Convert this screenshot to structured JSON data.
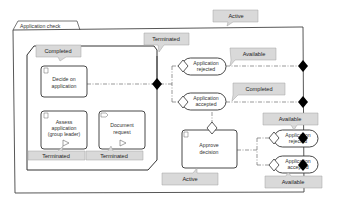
{
  "diagram": {
    "type": "CMMN case plan",
    "case": {
      "name": "Application check",
      "state": "Active"
    },
    "stage": {
      "state": "Completed",
      "exit_state": "Terminated"
    },
    "tasks": [
      {
        "id": "decide",
        "name_line1": "Decide on",
        "name_line2": "application",
        "kind": "human-task",
        "state": ""
      },
      {
        "id": "assess",
        "name_line1": "Assess",
        "name_line2": "application",
        "name_line3": "(group leader)",
        "kind": "human-task",
        "state": "Terminated"
      },
      {
        "id": "docreq",
        "name_line1": "Document",
        "name_line2": "request",
        "kind": "process-task",
        "state": "Terminated"
      },
      {
        "id": "approve",
        "name_line1": "Approve",
        "name_line2": "decision",
        "kind": "human-task",
        "state": "Active"
      }
    ],
    "milestones": [
      {
        "id": "ms1",
        "name_line1": "Application",
        "name_line2": "rejected",
        "state": "Available"
      },
      {
        "id": "ms2",
        "name_line1": "Application",
        "name_line2": "accepted",
        "state": "Completed"
      },
      {
        "id": "ms3",
        "name_line1": "Application",
        "name_line2": "rejected",
        "state": "Available"
      },
      {
        "id": "ms4",
        "name_line1": "Application",
        "name_line2": "accepted",
        "state": "Available"
      }
    ]
  },
  "colors": {
    "callout_fill": "#d9d9d9",
    "callout_stroke": "#a0a0a0",
    "line": "#333333",
    "sentry": "#000000"
  }
}
